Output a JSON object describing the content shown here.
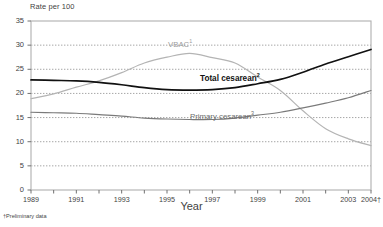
{
  "chart_data": {
    "type": "line",
    "title": "",
    "ylabel": "Rate per 100",
    "xlabel": "Year",
    "ylim": [
      0,
      35
    ],
    "xlim": [
      1989,
      2004
    ],
    "yticks": [
      0,
      5,
      10,
      15,
      20,
      25,
      30,
      35
    ],
    "xticks": [
      "1989",
      "1991",
      "1993",
      "1995",
      "1997",
      "1999",
      "2001",
      "2003",
      "2004†"
    ],
    "x": [
      1989,
      1990,
      1991,
      1992,
      1993,
      1994,
      1995,
      1996,
      1997,
      1998,
      1999,
      2000,
      2001,
      2002,
      2003,
      2004
    ],
    "grid": "horizontal-dotted",
    "legend": "inline-labels",
    "footnote": "†Preliminary data",
    "series": [
      {
        "name": "VBAC",
        "superscript": "1",
        "color": "#b4b4b4",
        "values": [
          18.9,
          19.9,
          21.3,
          22.6,
          24.3,
          26.3,
          27.5,
          28.3,
          27.4,
          26.3,
          23.4,
          20.6,
          16.4,
          12.7,
          10.6,
          9.2
        ]
      },
      {
        "name": "Total cesarean",
        "superscript": "2",
        "color": "#111111",
        "values": [
          22.8,
          22.7,
          22.6,
          22.3,
          21.8,
          21.2,
          20.8,
          20.7,
          20.8,
          21.2,
          22.0,
          22.9,
          24.4,
          26.1,
          27.6,
          29.1
        ]
      },
      {
        "name": "Primary cesarean",
        "superscript": "3",
        "color": "#7a7a7a",
        "values": [
          16.1,
          16.0,
          15.9,
          15.6,
          15.3,
          14.9,
          14.7,
          14.6,
          14.6,
          14.9,
          15.5,
          16.1,
          17.0,
          18.0,
          19.1,
          20.6
        ]
      }
    ],
    "labels": {
      "vbac_label": "VBAC",
      "vbac_sup": "1",
      "total_label": "Total cesarean",
      "total_sup": "2",
      "primary_label": "Primary cesarean",
      "primary_sup": "3"
    },
    "colors": {
      "vbac": "#b4b4b4",
      "total": "#111111",
      "primary": "#7a7a7a",
      "frame": "#b0b0b0",
      "grid": "#8f8f8f",
      "text": "#3f3f3f"
    }
  }
}
